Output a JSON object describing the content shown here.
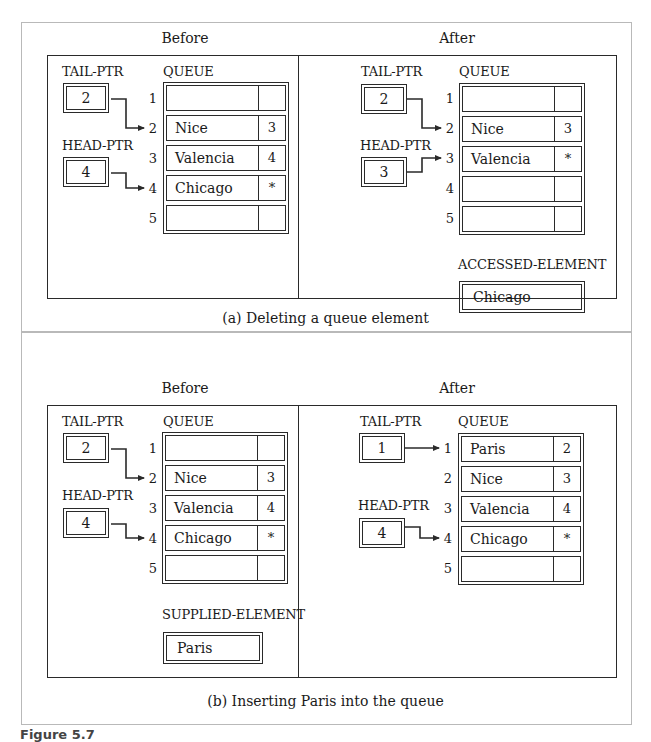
{
  "figure": {
    "caption_partial": "Figure 5.7"
  },
  "panel_a": {
    "caption": "(a) Deleting a queue element",
    "before": {
      "title": "Before",
      "tail_label": "TAIL-PTR",
      "tail_value": "2",
      "head_label": "HEAD-PTR",
      "head_value": "4",
      "queue_label": "QUEUE",
      "rows": [
        {
          "index": "1",
          "value": "",
          "next": ""
        },
        {
          "index": "2",
          "value": "Nice",
          "next": "3"
        },
        {
          "index": "3",
          "value": "Valencia",
          "next": "4"
        },
        {
          "index": "4",
          "value": "Chicago",
          "next": "*"
        },
        {
          "index": "5",
          "value": "",
          "next": ""
        }
      ]
    },
    "after": {
      "title": "After",
      "tail_label": "TAIL-PTR",
      "tail_value": "2",
      "head_label": "HEAD-PTR",
      "head_value": "3",
      "queue_label": "QUEUE",
      "rows": [
        {
          "index": "1",
          "value": "",
          "next": ""
        },
        {
          "index": "2",
          "value": "Nice",
          "next": "3"
        },
        {
          "index": "3",
          "value": "Valencia",
          "next": "*"
        },
        {
          "index": "4",
          "value": "",
          "next": ""
        },
        {
          "index": "5",
          "value": "",
          "next": ""
        }
      ],
      "element_label": "ACCESSED-ELEMENT",
      "element_value": "Chicago"
    }
  },
  "panel_b": {
    "caption": "(b) Inserting Paris into the queue",
    "before": {
      "title": "Before",
      "tail_label": "TAIL-PTR",
      "tail_value": "2",
      "head_label": "HEAD-PTR",
      "head_value": "4",
      "queue_label": "QUEUE",
      "rows": [
        {
          "index": "1",
          "value": "",
          "next": ""
        },
        {
          "index": "2",
          "value": "Nice",
          "next": "3"
        },
        {
          "index": "3",
          "value": "Valencia",
          "next": "4"
        },
        {
          "index": "4",
          "value": "Chicago",
          "next": "*"
        },
        {
          "index": "5",
          "value": "",
          "next": ""
        }
      ],
      "element_label": "SUPPLIED-ELEMENT",
      "element_value": "Paris"
    },
    "after": {
      "title": "After",
      "tail_label": "TAIL-PTR",
      "tail_value": "1",
      "head_label": "HEAD-PTR",
      "head_value": "4",
      "queue_label": "QUEUE",
      "rows": [
        {
          "index": "1",
          "value": "Paris",
          "next": "2"
        },
        {
          "index": "2",
          "value": "Nice",
          "next": "3"
        },
        {
          "index": "3",
          "value": "Valencia",
          "next": "4"
        },
        {
          "index": "4",
          "value": "Chicago",
          "next": "*"
        },
        {
          "index": "5",
          "value": "",
          "next": ""
        }
      ]
    }
  },
  "colors": {
    "line": "#2a2a2a",
    "panel_border": "#b9b9b9",
    "background": "#ffffff"
  }
}
